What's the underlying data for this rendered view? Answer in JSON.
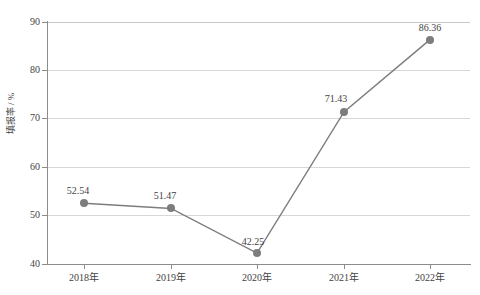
{
  "chart_data": {
    "type": "line",
    "title": "",
    "xlabel": "",
    "ylabel": "填报率 / %",
    "categories": [
      "2018年",
      "2019年",
      "2020年",
      "2021年",
      "2022年"
    ],
    "values": [
      52.54,
      51.47,
      42.25,
      71.43,
      86.36
    ],
    "data_labels": [
      "52.54",
      "51.47",
      "42.25",
      "71.43",
      "86.36"
    ],
    "ylim": [
      40,
      90
    ],
    "yticks": [
      40,
      50,
      60,
      70,
      80,
      90
    ],
    "ytick_labels": [
      "40",
      "50",
      "60",
      "70",
      "80",
      "90"
    ],
    "grid": true,
    "legend": false,
    "legend_position": "none",
    "series_color": "#7d7d7d",
    "gridline_color": "#d8d8d8",
    "axis_color": "#8c8c8c",
    "text_color": "#3f3f3f"
  }
}
